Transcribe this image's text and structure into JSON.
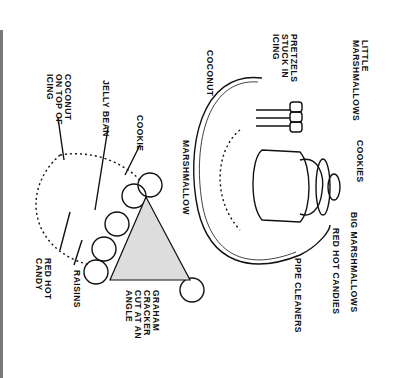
{
  "diagram": {
    "type": "craft-instruction-illustration",
    "orientation": "rotated-90-clockwise",
    "figures": [
      {
        "name": "snowman-on-plate",
        "labels": {
          "little_marshmallows": "LITTLE\nMARSHMALLOWS",
          "pretzels": "PRETZELS\nSTUCK IN\nICING",
          "coconut": "COCONUT",
          "cookies": "COOKIES",
          "big_marshmallows": "BIG MARSHMALLOWS",
          "red_hot_candies": "RED HOT CANDIES",
          "pipe_cleaners": "PIPE CLEANERS"
        }
      },
      {
        "name": "graham-cracker-tree",
        "labels": {
          "coconut_on_icing": "COCONUT\nON TOP OF\nICING",
          "jelly_bean": "JELLY BEAN",
          "cookie": "COOKIE",
          "marshmallow": "MARSHMALLOW",
          "red_hot_candy": "RED HOT\nCANDY",
          "raisins": "RAISINS",
          "graham_cracker": "GRAHAM\nCRACKER\nCUT AT AN\nANGLE"
        }
      }
    ],
    "colors": {
      "ink": "#111111",
      "paper": "#ffffff",
      "border": "#7a7a7a"
    }
  }
}
